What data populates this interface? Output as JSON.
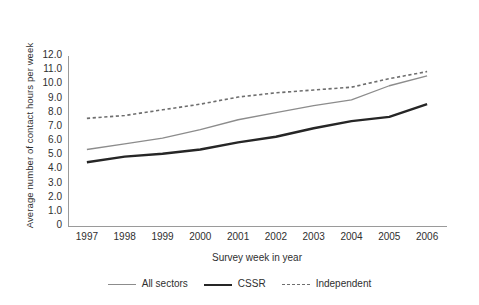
{
  "chart_data": {
    "type": "line",
    "title": "",
    "xlabel": "Survey week in year",
    "ylabel": "Average number of contact hours per week",
    "categories": [
      "1997",
      "1998",
      "1999",
      "2000",
      "2001",
      "2002",
      "2003",
      "2004",
      "2005",
      "2006"
    ],
    "x": [
      1997,
      1998,
      1999,
      2000,
      2001,
      2002,
      2003,
      2004,
      2005,
      2006
    ],
    "xlim": [
      1996.5,
      2006.5
    ],
    "ylim": [
      0,
      12
    ],
    "yticks": [
      "0",
      "1.0",
      "2.0",
      "3.0",
      "4.0",
      "5.0",
      "6.0",
      "7.0",
      "8.0",
      "9.0",
      "10.0",
      "11.0",
      "12.0"
    ],
    "ytick_values": [
      0,
      1,
      2,
      3,
      4,
      5,
      6,
      7,
      8,
      9,
      10,
      11,
      12
    ],
    "grid": false,
    "legend_position": "bottom",
    "series": [
      {
        "name": "All sectors",
        "style": "solid-thin",
        "color": "#8c8c8c",
        "values": [
          5.4,
          5.8,
          6.2,
          6.8,
          7.5,
          8.0,
          8.5,
          8.9,
          9.9,
          10.6
        ]
      },
      {
        "name": "CSSR",
        "style": "solid-thick",
        "color": "#262626",
        "values": [
          4.5,
          4.9,
          5.1,
          5.4,
          5.9,
          6.3,
          6.9,
          7.4,
          7.7,
          8.6
        ]
      },
      {
        "name": "Independent",
        "style": "dotted",
        "color": "#6e6e6e",
        "values": [
          7.6,
          7.8,
          8.2,
          8.6,
          9.1,
          9.4,
          9.6,
          9.8,
          10.4,
          10.9
        ]
      }
    ]
  }
}
